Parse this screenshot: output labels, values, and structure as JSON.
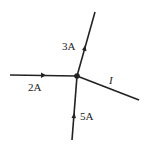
{
  "diagram": {
    "labels": {
      "left": "2A",
      "up": "3A",
      "down": "5A",
      "right": "I"
    },
    "colors": {
      "line": "#222222",
      "background": "#ffffff"
    }
  }
}
